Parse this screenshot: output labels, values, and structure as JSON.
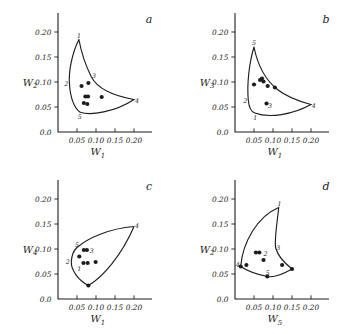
{
  "figure": {
    "background": "#ffffff",
    "ink_color": "#1d1d1d",
    "panel_letters": [
      "a",
      "b",
      "c",
      "d"
    ]
  },
  "chart_data": [
    {
      "type": "scatter",
      "panel_letter": "a",
      "xlabel": "W_1",
      "ylabel": "W_2",
      "xlabel_parts": {
        "base": "W",
        "sub": "1"
      },
      "ylabel_parts": {
        "base": "W",
        "sub": "2"
      },
      "xlim": [
        0,
        0.23
      ],
      "ylim": [
        0,
        0.235
      ],
      "x_ticks": [
        0.05,
        0.1,
        0.15,
        0.2
      ],
      "x_tick_labels": [
        "0.05",
        "0.10",
        "0.15",
        "0.20"
      ],
      "y_ticks": [
        0.05,
        0.1,
        0.15,
        0.2
      ],
      "y_tick_labels": [
        "0.05",
        "0.10",
        "0.15",
        "0.20"
      ],
      "origin_tick_label": "0.0",
      "grid": false,
      "points": [
        [
          0.062,
          0.092
        ],
        [
          0.08,
          0.098
        ],
        [
          0.072,
          0.071
        ],
        [
          0.079,
          0.071
        ],
        [
          0.068,
          0.058
        ],
        [
          0.077,
          0.056
        ],
        [
          0.115,
          0.07
        ]
      ],
      "boundary_curve": [
        [
          "M",
          0.055,
          0.185
        ],
        [
          "C",
          0.037,
          0.158,
          0.028,
          0.122,
          0.03,
          0.097
        ],
        [
          "C",
          0.032,
          0.072,
          0.041,
          0.05,
          0.057,
          0.04
        ],
        [
          "C",
          0.085,
          0.032,
          0.15,
          0.04,
          0.2,
          0.065
        ],
        [
          "C",
          0.148,
          0.072,
          0.106,
          0.084,
          0.088,
          0.11
        ],
        [
          "C",
          0.076,
          0.128,
          0.063,
          0.152,
          0.055,
          0.185
        ]
      ],
      "labels": [
        {
          "text": "1",
          "x": 0.055,
          "y": 0.193
        },
        {
          "text": "2",
          "x": 0.022,
          "y": 0.097
        },
        {
          "text": "3",
          "x": 0.095,
          "y": 0.113
        },
        {
          "text": "4",
          "x": 0.208,
          "y": 0.063
        },
        {
          "text": "5",
          "x": 0.057,
          "y": 0.031
        }
      ]
    },
    {
      "type": "scatter",
      "panel_letter": "b",
      "xlabel": "W_1",
      "ylabel": "W_3",
      "xlabel_parts": {
        "base": "W",
        "sub": "1"
      },
      "ylabel_parts": {
        "base": "W",
        "sub": "3"
      },
      "xlim": [
        0,
        0.23
      ],
      "ylim": [
        0,
        0.235
      ],
      "x_ticks": [
        0.05,
        0.1,
        0.15,
        0.2
      ],
      "x_tick_labels": [
        "0.05",
        "0.10",
        "0.15",
        "0.20"
      ],
      "y_ticks": [
        0.05,
        0.1,
        0.15,
        0.2
      ],
      "y_tick_labels": [
        "0.05",
        "0.10",
        "0.15",
        "0.20"
      ],
      "origin_tick_label": "0.0",
      "grid": false,
      "points": [
        [
          0.05,
          0.095
        ],
        [
          0.066,
          0.104
        ],
        [
          0.071,
          0.107
        ],
        [
          0.075,
          0.101
        ],
        [
          0.086,
          0.092
        ],
        [
          0.105,
          0.089
        ],
        [
          0.083,
          0.057
        ]
      ],
      "boundary_curve": [
        [
          "M",
          0.05,
          0.17
        ],
        [
          "C",
          0.037,
          0.138,
          0.031,
          0.095,
          0.035,
          0.063
        ],
        [
          "C",
          0.037,
          0.049,
          0.043,
          0.04,
          0.052,
          0.038
        ],
        [
          "C",
          0.09,
          0.027,
          0.152,
          0.035,
          0.2,
          0.055
        ],
        [
          "C",
          0.142,
          0.067,
          0.072,
          0.085,
          0.05,
          0.17
        ]
      ],
      "labels": [
        {
          "text": "5",
          "x": 0.05,
          "y": 0.178
        },
        {
          "text": "2",
          "x": 0.027,
          "y": 0.062
        },
        {
          "text": "1",
          "x": 0.053,
          "y": 0.029
        },
        {
          "text": "4",
          "x": 0.207,
          "y": 0.052
        },
        {
          "text": "3",
          "x": 0.092,
          "y": 0.053
        }
      ]
    },
    {
      "type": "scatter",
      "panel_letter": "c",
      "xlabel": "W_1",
      "ylabel": "W_4",
      "xlabel_parts": {
        "base": "W",
        "sub": "1"
      },
      "ylabel_parts": {
        "base": "W",
        "sub": "4"
      },
      "xlim": [
        0,
        0.23
      ],
      "ylim": [
        0,
        0.235
      ],
      "x_ticks": [
        0.05,
        0.1,
        0.15,
        0.2
      ],
      "x_tick_labels": [
        "0.05",
        "0.10",
        "0.15",
        "0.20"
      ],
      "y_ticks": [
        0.05,
        0.1,
        0.15,
        0.2
      ],
      "y_tick_labels": [
        "0.05",
        "0.10",
        "0.15",
        "0.20"
      ],
      "origin_tick_label": "0.0",
      "grid": false,
      "points": [
        [
          0.068,
          0.098
        ],
        [
          0.076,
          0.098
        ],
        [
          0.056,
          0.085
        ],
        [
          0.067,
          0.072
        ],
        [
          0.078,
          0.072
        ],
        [
          0.099,
          0.074
        ],
        [
          0.08,
          0.027
        ]
      ],
      "boundary_curve": [
        [
          "M",
          0.2,
          0.145
        ],
        [
          "C",
          0.135,
          0.141,
          0.078,
          0.122,
          0.05,
          0.103
        ],
        [
          "C",
          0.041,
          0.097,
          0.036,
          0.086,
          0.035,
          0.075
        ],
        [
          "C",
          0.034,
          0.059,
          0.053,
          0.037,
          0.08,
          0.027
        ],
        [
          "C",
          0.118,
          0.043,
          0.168,
          0.088,
          0.2,
          0.145
        ]
      ],
      "labels": [
        {
          "text": "4",
          "x": 0.208,
          "y": 0.147
        },
        {
          "text": "5",
          "x": 0.05,
          "y": 0.108
        },
        {
          "text": "2",
          "x": 0.026,
          "y": 0.074
        },
        {
          "text": "1",
          "x": 0.056,
          "y": 0.06
        },
        {
          "text": "3",
          "x": 0.089,
          "y": 0.096
        }
      ]
    },
    {
      "type": "scatter",
      "panel_letter": "d",
      "xlabel": "W_5",
      "ylabel": "W_2",
      "xlabel_parts": {
        "base": "W",
        "sub": "5"
      },
      "ylabel_parts": {
        "base": "W",
        "sub": "2"
      },
      "xlim": [
        0,
        0.23
      ],
      "ylim": [
        0,
        0.235
      ],
      "x_ticks": [
        0.05,
        0.1,
        0.15,
        0.2
      ],
      "x_tick_labels": [
        "0.05",
        "0.10",
        "0.15",
        "0.20"
      ],
      "y_ticks": [
        0.05,
        0.1,
        0.15,
        0.2
      ],
      "y_tick_labels": [
        "0.05",
        "0.10",
        "0.15",
        "0.20"
      ],
      "origin_tick_label": "0.0",
      "grid": false,
      "points": [
        [
          0.015,
          0.065
        ],
        [
          0.03,
          0.068
        ],
        [
          0.055,
          0.093
        ],
        [
          0.064,
          0.093
        ],
        [
          0.075,
          0.078
        ],
        [
          0.124,
          0.068
        ],
        [
          0.15,
          0.06
        ],
        [
          0.085,
          0.045
        ]
      ],
      "boundary_curve": [
        [
          "M",
          0.015,
          0.065
        ],
        [
          "C",
          0.02,
          0.112,
          0.058,
          0.165,
          0.115,
          0.183
        ],
        [
          "C",
          0.111,
          0.152,
          0.103,
          0.118,
          0.107,
          0.102
        ],
        [
          "C",
          0.113,
          0.086,
          0.135,
          0.069,
          0.15,
          0.06
        ],
        [
          "C",
          0.118,
          0.046,
          0.098,
          0.043,
          0.085,
          0.045
        ],
        [
          "C",
          0.06,
          0.049,
          0.032,
          0.056,
          0.015,
          0.065
        ]
      ],
      "labels": [
        {
          "text": "1",
          "x": 0.117,
          "y": 0.191
        },
        {
          "text": "3",
          "x": 0.114,
          "y": 0.103
        },
        {
          "text": "5",
          "x": 0.086,
          "y": 0.053
        },
        {
          "text": "2",
          "x": 0.08,
          "y": 0.091
        },
        {
          "text": "4",
          "x": 0.007,
          "y": 0.068
        }
      ]
    }
  ]
}
